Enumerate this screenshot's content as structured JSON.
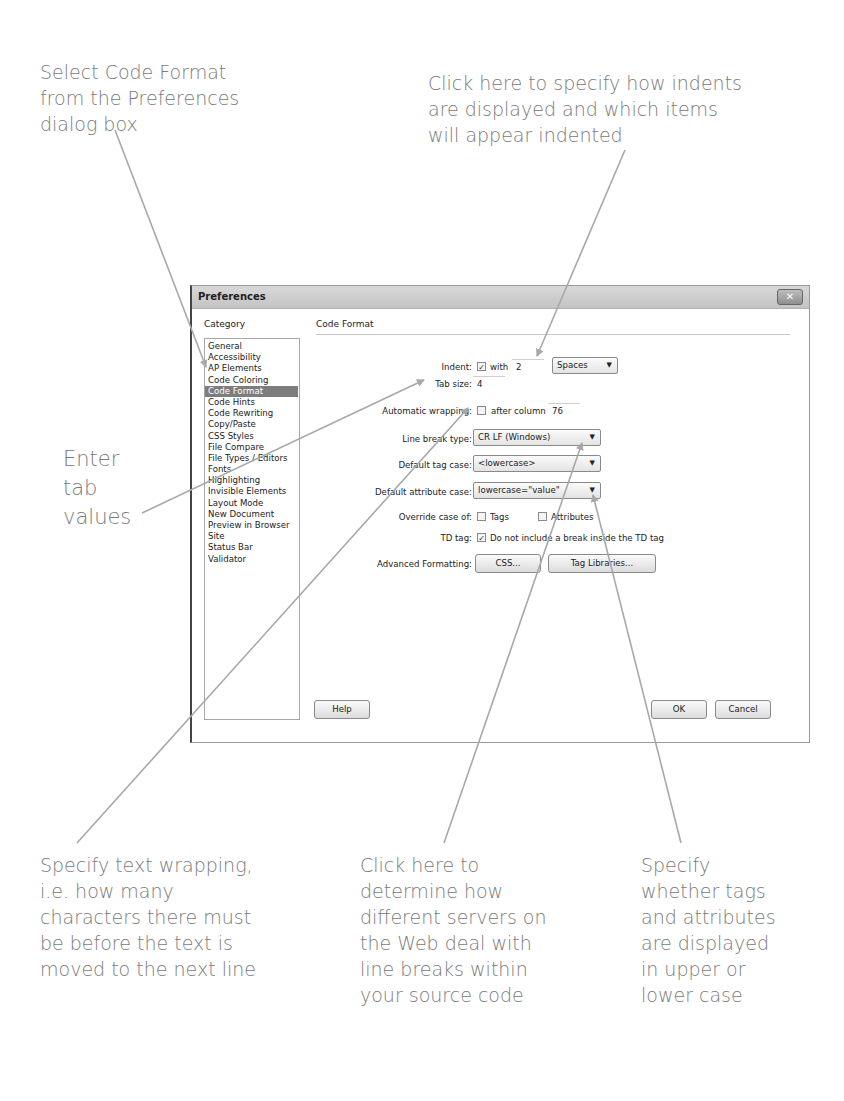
{
  "annotations": {
    "select_code_format": "Select Code Format\nfrom the Preferences\ndialog box",
    "indents": "Click here to specify how indents\nare displayed and which items\nwill appear indented",
    "tab_values": "Enter\ntab\nvalues",
    "text_wrapping": "Specify text wrapping,\ni.e. how many\ncharacters there must\nbe before the text is\nmoved to the next line",
    "line_breaks": "Click here to\ndetermine how\ndifferent servers on\nthe Web deal with\nline breaks within\nyour source code",
    "case": "Specify\nwhether tags\nand attributes\nare displayed\nin upper or\nlower case"
  },
  "dialog": {
    "title": "Preferences",
    "close_glyph": "✕",
    "category_header": "Category",
    "panel_header": "Code Format",
    "categories": [
      "General",
      "Accessibility",
      "AP Elements",
      "Code Coloring",
      "Code Format",
      "Code Hints",
      "Code Rewriting",
      "Copy/Paste",
      "CSS Styles",
      "File Compare",
      "File Types / Editors",
      "Fonts",
      "Highlighting",
      "Invisible Elements",
      "Layout Mode",
      "New Document",
      "Preview in Browser",
      "Site",
      "Status Bar",
      "Validator"
    ],
    "selected_category": "Code Format",
    "fields": {
      "indent_label": "Indent:",
      "indent_checked": true,
      "indent_with": "with",
      "indent_value": "2",
      "indent_unit": "Spaces",
      "tab_size_label": "Tab size:",
      "tab_size_value": "4",
      "wrapping_label": "Automatic wrapping:",
      "wrapping_checked": false,
      "wrapping_after": "after column",
      "wrapping_value": "76",
      "line_break_label": "Line break type:",
      "line_break_value": "CR LF (Windows)",
      "tag_case_label": "Default tag case:",
      "tag_case_value": "<lowercase>",
      "attr_case_label": "Default attribute case:",
      "attr_case_value": "lowercase=\"value\"",
      "override_label": "Override case of:",
      "override_tags": "Tags",
      "override_tags_checked": false,
      "override_attrs": "Attributes",
      "override_attrs_checked": false,
      "td_label": "TD tag:",
      "td_checked": true,
      "td_text": "Do not include a break inside the TD tag",
      "advanced_label": "Advanced Formatting:",
      "css_button": "CSS...",
      "tag_libraries_button": "Tag Libraries..."
    },
    "buttons": {
      "help": "Help",
      "ok": "OK",
      "cancel": "Cancel"
    }
  },
  "colors": {
    "annotation_text": "#7a7a7a",
    "callout_line": "#a8a8a8",
    "selected_category_bg": "#7d7d7d"
  }
}
